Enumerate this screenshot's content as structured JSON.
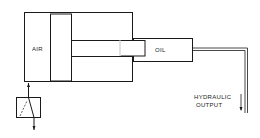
{
  "diagram": {
    "type": "air-over-oil hydraulic intensifier schematic",
    "labels": {
      "air": "AIR",
      "oil": "OIL",
      "output_line1": "HYDRAULIC",
      "output_line2": "OUTPUT"
    },
    "components": [
      {
        "id": "air-cylinder",
        "label": "AIR"
      },
      {
        "id": "piston"
      },
      {
        "id": "piston-rod"
      },
      {
        "id": "oil-cylinder",
        "label": "OIL"
      },
      {
        "id": "output-pipe",
        "label": "HYDRAULIC OUTPUT"
      },
      {
        "id": "control-valve"
      }
    ],
    "colors": {
      "line": "#1a1a1a",
      "background": "#ffffff"
    }
  }
}
